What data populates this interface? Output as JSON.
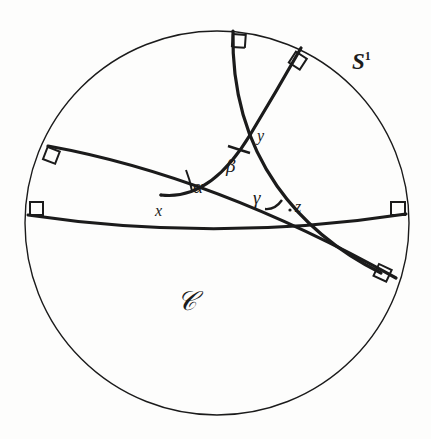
{
  "figure": {
    "background_color": "#fdfdfc",
    "ink_color": "#1b1b1b",
    "boundary_circle": {
      "name": "S1",
      "label": "S",
      "label_superscript": "1",
      "cx": 217,
      "cy": 223,
      "r": 192,
      "stroke_width": 1.4
    },
    "region": {
      "label": "𝒞",
      "x": 188,
      "y": 304
    },
    "sphere_label": {
      "x": 352,
      "y": 62
    },
    "vertices": [
      {
        "id": "x",
        "label": "x",
        "px": 161,
        "py": 195,
        "label_x": 155,
        "label_y": 206
      },
      {
        "id": "y",
        "label": "y",
        "px": 250,
        "py": 135,
        "label_x": 255,
        "label_y": 131
      },
      {
        "id": "z",
        "label": "z",
        "px": 290,
        "py": 210,
        "label_x": 294,
        "label_y": 203
      }
    ],
    "angles": [
      {
        "id": "alpha",
        "label": "α",
        "at_vertex": "x",
        "label_x": 193,
        "label_y": 180
      },
      {
        "id": "beta",
        "label": "β",
        "at_vertex": "y",
        "label_x": 228,
        "label_y": 160
      },
      {
        "id": "gamma",
        "label": "γ",
        "at_vertex": "z",
        "label_x": 255,
        "label_y": 192
      }
    ],
    "geodesics": [
      {
        "id": "geodesic-horizontal",
        "through": [
          "x",
          "z"
        ],
        "start": {
          "x": 28,
          "y": 215
        },
        "end": {
          "x": 406,
          "y": 214
        },
        "sagitta": 14
      },
      {
        "id": "geodesic-upper-left-to-lower-right",
        "through": [
          "x",
          "y"
        ],
        "start": {
          "x": 48,
          "y": 146
        },
        "end": {
          "x": 396,
          "y": 278
        },
        "sagitta": 26
      },
      {
        "id": "geodesic-top-to-bottom-right",
        "through": [
          "y",
          "z"
        ],
        "start": {
          "x": 233,
          "y": 31
        },
        "end": {
          "x": 301,
          "y": 48
        },
        "sagitta": 0
      }
    ],
    "right_angle_marks": [
      {
        "id": "mark-top-center",
        "x": 236,
        "y": 36,
        "rotation": 4
      },
      {
        "id": "mark-top-right",
        "x": 297,
        "y": 52,
        "rotation": 32
      },
      {
        "id": "mark-left-upper",
        "x": 52,
        "y": 150,
        "rotation": 20
      },
      {
        "id": "mark-left-lower",
        "x": 32,
        "y": 212,
        "rotation": 0
      },
      {
        "id": "mark-right-middle",
        "x": 392,
        "y": 212,
        "rotation": 0
      },
      {
        "id": "mark-right-lower",
        "x": 381,
        "y": 272,
        "rotation": 22
      }
    ],
    "notes": {
      "type": "geometry-diagram",
      "model": "Poincare disk",
      "description": "Three geodesic arcs meeting the boundary circle orthogonally, forming a hyperbolic triangle with vertices x, y, z and interior angles alpha, beta, gamma."
    }
  }
}
